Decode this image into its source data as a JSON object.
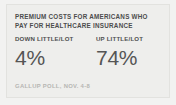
{
  "card": {
    "headline_lines": [
      "PREMIUM COSTS FOR AMERICANS WHO",
      "PAY FOR HEALTHCARE INSURANCE"
    ],
    "stats": [
      {
        "label": "DOWN LITTLE/LOT",
        "value": "4%"
      },
      {
        "label": "UP LITTLE/LOT",
        "value": "74%"
      }
    ],
    "source": "GALLUP POLL, NOV. 4-8"
  },
  "colors": {
    "background": "#f2f2f1",
    "panel": "#eeeeec",
    "border": "#e2e2df",
    "headline_text": "#4c4c4c",
    "label_text": "#4f4f4f",
    "value_text": "#555555",
    "source_text": "#b6b6b3"
  },
  "chart_data": {
    "type": "bar",
    "title": "PREMIUM COSTS FOR AMERICANS WHO PAY FOR HEALTHCARE INSURANCE",
    "categories": [
      "DOWN LITTLE/LOT",
      "UP LITTLE/LOT"
    ],
    "values": [
      4,
      74
    ],
    "value_labels": [
      "4%",
      "74%"
    ],
    "xlabel": "",
    "ylabel": "Percent of respondents",
    "ylim": [
      0,
      100
    ],
    "grid": false,
    "legend": "none",
    "annotations": [
      "GALLUP POLL, NOV. 4-8"
    ]
  }
}
